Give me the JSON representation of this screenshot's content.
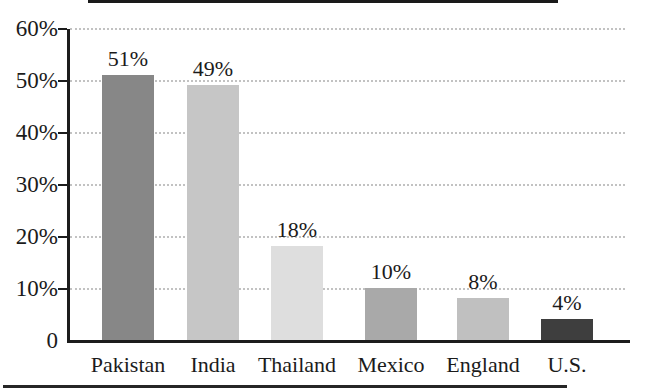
{
  "figure": {
    "background": "#ffffff"
  },
  "chart_data": {
    "type": "bar",
    "categories": [
      "Pakistan",
      "India",
      "Thailand",
      "Mexico",
      "England",
      "U.S."
    ],
    "values": [
      51,
      49,
      18,
      10,
      8,
      4
    ],
    "value_labels": [
      "51%",
      "49%",
      "18%",
      "10%",
      "8%",
      "4%"
    ],
    "bar_colors": [
      "#878787",
      "#c6c6c6",
      "#dedede",
      "#a9a9a9",
      "#c0c0c0",
      "#3e3e3e"
    ],
    "ytick_labels": [
      "60%",
      "50%",
      "40%",
      "30%",
      "20%",
      "10%",
      "0"
    ],
    "ytick_values": [
      60,
      50,
      40,
      30,
      20,
      10,
      0
    ],
    "ylim": [
      0,
      60
    ],
    "grid": "horizontal-dotted",
    "legend": "none",
    "axis_color": "#1c1c1c",
    "grid_color": "#c2c2c2",
    "text_color": "#1b1b1b"
  }
}
